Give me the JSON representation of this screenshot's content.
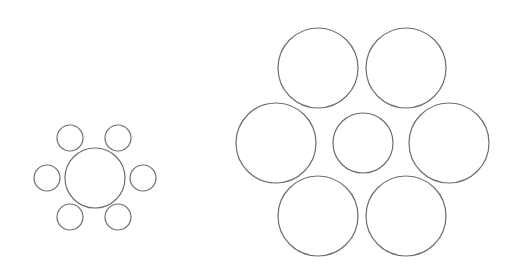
{
  "figure": {
    "name": "Ebbinghaus illusion",
    "stroke_color": "#6e6e6e",
    "background": "#ffffff",
    "groups": [
      {
        "id": "small-surround",
        "center_circle": {
          "cx": 95,
          "cy": 178,
          "r": 30
        },
        "surround_circles": [
          {
            "cx": 70,
            "cy": 138,
            "r": 13
          },
          {
            "cx": 118,
            "cy": 138,
            "r": 13
          },
          {
            "cx": 47,
            "cy": 178,
            "r": 13
          },
          {
            "cx": 143,
            "cy": 178,
            "r": 13
          },
          {
            "cx": 70,
            "cy": 217,
            "r": 13
          },
          {
            "cx": 118,
            "cy": 217,
            "r": 13
          }
        ]
      },
      {
        "id": "large-surround",
        "center_circle": {
          "cx": 363,
          "cy": 143,
          "r": 30
        },
        "surround_circles": [
          {
            "cx": 318,
            "cy": 68,
            "r": 40
          },
          {
            "cx": 406,
            "cy": 68,
            "r": 40
          },
          {
            "cx": 276,
            "cy": 143,
            "r": 40
          },
          {
            "cx": 449,
            "cy": 143,
            "r": 40
          },
          {
            "cx": 318,
            "cy": 216,
            "r": 40
          },
          {
            "cx": 406,
            "cy": 216,
            "r": 40
          }
        ]
      }
    ]
  }
}
